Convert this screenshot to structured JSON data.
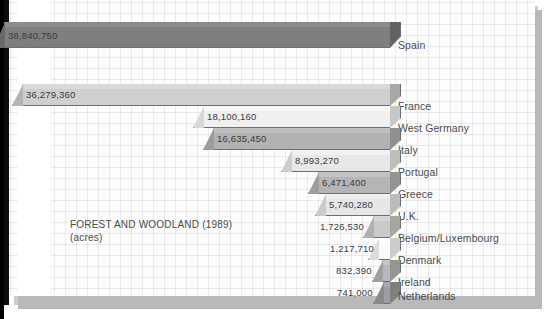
{
  "chart_data": {
    "type": "bar",
    "orientation": "horizontal",
    "title": "FOREST AND WOODLAND (1989)",
    "subtitle": "(acres)",
    "xlabel": "",
    "ylabel": "",
    "unit": "acres",
    "year": "1989",
    "grid": true,
    "legend": "none",
    "style": "3d-horizontal-bars-right-aligned",
    "categories": [
      "Spain",
      "France",
      "West Germany",
      "Italy",
      "Portugal",
      "Greece",
      "U.K.",
      "Belgium/Luxembourg",
      "Denmark",
      "Ireland",
      "Netherlands"
    ],
    "values": [
      38840750,
      36279360,
      18100160,
      16635450,
      8993270,
      6471400,
      5740280,
      1726530,
      1217710,
      832390,
      741000
    ],
    "value_labels": [
      "38,840,750",
      "36,279,360",
      "18,100,160",
      "16,635,450",
      "8,993,270",
      "6,471,400",
      "5,740,280",
      "1,726,530",
      "1,217,710",
      "832,390",
      "741,000"
    ],
    "xlim": [
      0,
      38840750
    ]
  },
  "bars": [
    {
      "label": "Spain",
      "value_label": "38,840,750",
      "x": 4,
      "y": 22,
      "w": 386,
      "h": 26,
      "face": "#7f7f7f",
      "top": "#8c8c8c",
      "cap": "#6a6a6a",
      "side": "#636363",
      "vx": 8,
      "vy": 30,
      "cx": 398,
      "cy": 39
    },
    {
      "label": "France",
      "value_label": "36,279,360",
      "x": 22,
      "y": 84,
      "w": 368,
      "h": 22,
      "face": "#cfcfcf",
      "top": "#dadada",
      "cap": "#b4b4b4",
      "side": "#a8a8a8",
      "vx": 26,
      "vy": 89,
      "cx": 398,
      "cy": 100
    },
    {
      "label": "West Germany",
      "value_label": "18,100,160",
      "x": 203,
      "y": 106,
      "w": 187,
      "h": 22,
      "face": "#f0f0f0",
      "top": "#f7f7f7",
      "cap": "#d8d8d8",
      "side": "#c7c7c7",
      "vx": 207,
      "vy": 111,
      "cx": 398,
      "cy": 122
    },
    {
      "label": "Italy",
      "value_label": "16,635,450",
      "x": 213,
      "y": 128,
      "w": 177,
      "h": 22,
      "face": "#b2b2b2",
      "top": "#c0c0c0",
      "cap": "#9b9b9b",
      "side": "#909090",
      "vx": 217,
      "vy": 133,
      "cx": 398,
      "cy": 144
    },
    {
      "label": "Portugal",
      "value_label": "8,993,270",
      "x": 291,
      "y": 150,
      "w": 99,
      "h": 22,
      "face": "#e8e8e8",
      "top": "#f1f1f1",
      "cap": "#cdcdcd",
      "side": "#bebebe",
      "vx": 295,
      "vy": 155,
      "cx": 398,
      "cy": 166
    },
    {
      "label": "Greece",
      "value_label": "6,471,400",
      "x": 318,
      "y": 172,
      "w": 72,
      "h": 22,
      "face": "#b5b5b5",
      "top": "#c3c3c3",
      "cap": "#9e9e9e",
      "side": "#939393",
      "vx": 322,
      "vy": 177,
      "cx": 398,
      "cy": 188
    },
    {
      "label": "U.K.",
      "value_label": "5,740,280",
      "x": 325,
      "y": 194,
      "w": 65,
      "h": 22,
      "face": "#e6e6e6",
      "top": "#efefef",
      "cap": "#cbcbcb",
      "side": "#bcbcbc",
      "vx": 329,
      "vy": 199,
      "cx": 398,
      "cy": 210
    },
    {
      "label": "Belgium/Luxembourg",
      "value_label": "1,726,530",
      "x": 373,
      "y": 216,
      "w": 17,
      "h": 22,
      "face": "#cacaca",
      "top": "#d6d6d6",
      "cap": "#b0b0b0",
      "side": "#a5a5a5",
      "vx": 320,
      "vy": 221,
      "cx": 398,
      "cy": 232
    },
    {
      "label": "Denmark",
      "value_label": "1,217,710",
      "x": 378,
      "y": 238,
      "w": 12,
      "h": 22,
      "face": "#fafafa",
      "top": "#ffffff",
      "cap": "#dcdcdc",
      "side": "#cccccc",
      "vx": 330,
      "vy": 243,
      "cx": 398,
      "cy": 254
    },
    {
      "label": "Ireland",
      "value_label": "832,390",
      "x": 382,
      "y": 260,
      "w": 8,
      "h": 22,
      "face": "#b8b8b8",
      "top": "#c6c6c6",
      "cap": "#a0a0a0",
      "side": "#959595",
      "vx": 336,
      "vy": 265,
      "cx": 398,
      "cy": 276
    },
    {
      "label": "Netherlands",
      "value_label": "741,000",
      "x": 383,
      "y": 282,
      "w": 7,
      "h": 22,
      "face": "#9e9e9e",
      "top": "#ababab",
      "cap": "#8a8a8a",
      "side": "#7f7f7f",
      "vx": 337,
      "vy": 287,
      "cx": 398,
      "cy": 290
    }
  ]
}
